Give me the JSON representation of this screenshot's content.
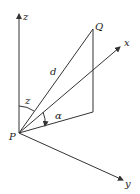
{
  "diagram": {
    "labels": {
      "z_axis": "z",
      "x_axis": "x",
      "y_axis": "y",
      "point_q": "Q",
      "point_p": "P",
      "distance": "d",
      "zenith_angle": "z",
      "elevation_angle": "α"
    },
    "colors": {
      "line": "#333333",
      "text": "#222222",
      "background": "#ffffff"
    }
  }
}
